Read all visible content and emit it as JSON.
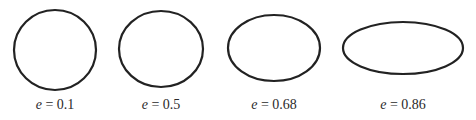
{
  "figure": {
    "stroke_color": "#222222",
    "stroke_width": 2.2,
    "ellipses": [
      {
        "cx": 55,
        "cy": 50,
        "rx": 41,
        "ry": 40,
        "var": "e",
        "eq": " = ",
        "value": "0.1"
      },
      {
        "cx": 161,
        "cy": 49,
        "rx": 42,
        "ry": 38,
        "var": "e",
        "eq": " = ",
        "value": "0.5"
      },
      {
        "cx": 274,
        "cy": 48,
        "rx": 46,
        "ry": 33,
        "var": "e",
        "eq": " = ",
        "value": "0.68"
      },
      {
        "cx": 403,
        "cy": 48,
        "rx": 60,
        "ry": 26,
        "var": "e",
        "eq": " = ",
        "value": "0.86"
      }
    ]
  }
}
